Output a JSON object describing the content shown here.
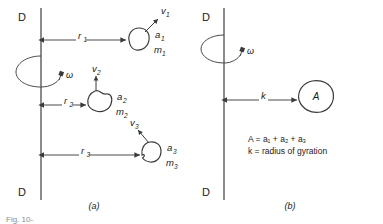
{
  "figure": {
    "label": "Fig. 10-",
    "panels": [
      {
        "id": "a",
        "label": "(a)"
      },
      {
        "id": "b",
        "label": "(b)"
      }
    ]
  },
  "panel_a": {
    "axis": {
      "top_label": "D",
      "bottom_label": "D",
      "name": "rotation-axis-dd"
    },
    "omega": {
      "symbol": "ω"
    },
    "masses": [
      {
        "radius_label": "r",
        "radius_sub": "1",
        "area_label": "a",
        "area_sub": "1",
        "mass_label": "m",
        "mass_sub": "1",
        "velocity_label": "v",
        "velocity_sub": "1"
      },
      {
        "radius_label": "r",
        "radius_sub": "2",
        "area_label": "a",
        "area_sub": "2",
        "mass_label": "m",
        "mass_sub": "2",
        "velocity_label": "v",
        "velocity_sub": "2"
      },
      {
        "radius_label": "r",
        "radius_sub": "3",
        "area_label": "a",
        "area_sub": "3",
        "mass_label": "m",
        "mass_sub": "3",
        "velocity_label": "v",
        "velocity_sub": "3"
      }
    ]
  },
  "panel_b": {
    "axis": {
      "top_label": "D",
      "bottom_label": "D",
      "name": "rotation-axis-dd"
    },
    "omega": {
      "symbol": "ω"
    },
    "body": {
      "area_label": "A",
      "radius_label": "k"
    },
    "notes": {
      "line1_lhs": "A",
      "line1_rhs": " = a₁ + a₂ + a₃",
      "line1_plain": "A = a₁ + a₂ + a₃",
      "line2_lhs": "k",
      "line2_rhs": " = radius of gyration",
      "line2_plain": "k = radius of gyration"
    }
  },
  "colors": {
    "axis": "#6e6e6e",
    "dimension": "#4a4a4a",
    "outline": "#3a3a3a",
    "text": "#222222",
    "figure_label": "#8d8d8d"
  }
}
